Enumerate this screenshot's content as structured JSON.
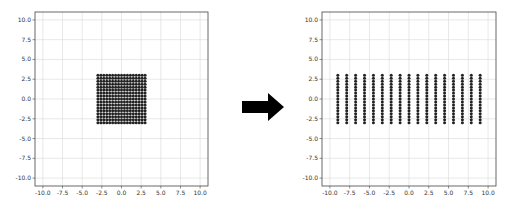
{
  "chart_data": [
    {
      "type": "scatter",
      "title": "",
      "xlabel": "",
      "ylabel": "",
      "xlim": [
        -11,
        11
      ],
      "ylim": [
        -11,
        11
      ],
      "grid": true,
      "xticks": [
        -10.0,
        -7.5,
        -5.0,
        -2.5,
        0.0,
        2.5,
        5.0,
        7.5,
        10.0
      ],
      "yticks": [
        -10.0,
        -7.5,
        -5.0,
        -2.5,
        0.0,
        2.5,
        5.0,
        7.5,
        10.0
      ],
      "xtick_labels": [
        "-10.0",
        "-7.5",
        "-5.0",
        "-2.5",
        "0.0",
        "2.5",
        "5.0",
        "7.5",
        "10.0"
      ],
      "ytick_labels": [
        "-10.0",
        "-7.5",
        "-5.0",
        "-2.5",
        "0.0",
        "2.5",
        "5.0",
        "7.5",
        "10.0"
      ],
      "series": [
        {
          "name": "grid points (before)",
          "x_range": [
            -3,
            3
          ],
          "y_range": [
            -3,
            3
          ],
          "nx": 17,
          "ny": 17,
          "color": "#222222"
        }
      ]
    },
    {
      "type": "scatter",
      "title": "",
      "xlabel": "",
      "ylabel": "",
      "xlim": [
        -11,
        11
      ],
      "ylim": [
        -11,
        11
      ],
      "grid": true,
      "xticks": [
        -10.0,
        -7.5,
        -5.0,
        -2.5,
        0.0,
        2.5,
        5.0,
        7.5,
        10.0
      ],
      "yticks": [
        -10.0,
        -7.5,
        -5.0,
        -2.5,
        0.0,
        2.5,
        5.0,
        7.5,
        10.0
      ],
      "xtick_labels": [
        "-10.0",
        "-7.5",
        "-5.0",
        "-2.5",
        "0.0",
        "2.5",
        "5.0",
        "7.5",
        "10.0"
      ],
      "ytick_labels": [
        "-10.0",
        "-7.5",
        "-5.0",
        "-2.5",
        "0.0",
        "2.5",
        "5.0",
        "7.5",
        "10.0"
      ],
      "series": [
        {
          "name": "grid points (after x-stretch)",
          "x_range": [
            -9,
            9
          ],
          "y_range": [
            -3,
            3
          ],
          "nx": 17,
          "ny": 17,
          "color": "#222222"
        }
      ]
    }
  ],
  "arrow": {
    "direction": "right",
    "color": "#000000"
  },
  "layout": {
    "plots": [
      {
        "left": 35,
        "top": 12,
        "right": 208,
        "bottom": 186
      },
      {
        "left": 322,
        "top": 12,
        "right": 496,
        "bottom": 186
      }
    ]
  }
}
